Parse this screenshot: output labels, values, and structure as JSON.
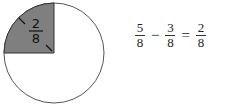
{
  "diagram": {
    "type": "fraction-circle",
    "total_parts": 8,
    "shaded_parts": 2,
    "shaded_label": {
      "numerator": "2",
      "denominator": "8"
    },
    "colors": {
      "shaded": "#7f7f7f",
      "outline": "#555555",
      "background": "#ffffff"
    }
  },
  "equation": {
    "terms": [
      {
        "numerator": "5",
        "denominator": "8"
      },
      {
        "numerator": "3",
        "denominator": "8"
      },
      {
        "numerator": "2",
        "denominator": "8"
      }
    ],
    "operators": [
      "−",
      "="
    ]
  }
}
